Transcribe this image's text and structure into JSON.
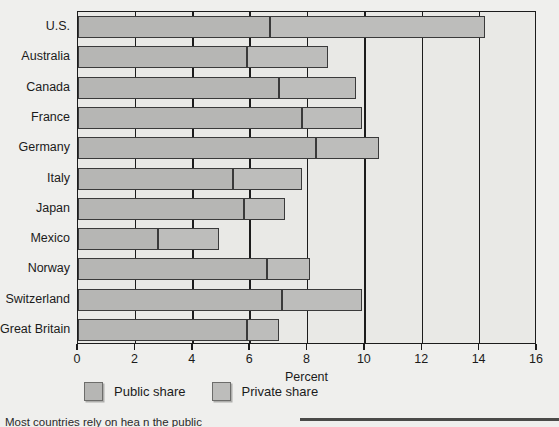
{
  "chart_data": {
    "type": "bar",
    "orientation": "horizontal",
    "stacked": true,
    "title": "",
    "xlabel": "Percent",
    "ylabel": "",
    "xlim": [
      0,
      16
    ],
    "xticks": [
      0,
      2,
      4,
      6,
      8,
      10,
      12,
      14,
      16
    ],
    "xticklabels": [
      "0",
      "2",
      "4",
      "6",
      "8",
      "10",
      "12",
      "14",
      "16"
    ],
    "grid": true,
    "grid_axis": "x",
    "legend_position": "below",
    "categories": [
      "U.S.",
      "Australia",
      "Canada",
      "France",
      "Germany",
      "Italy",
      "Japan",
      "Mexico",
      "Norway",
      "Switzerland",
      "Great Britain"
    ],
    "series": [
      {
        "name": "Public share",
        "color": "#b6b6b4",
        "values": [
          6.7,
          5.9,
          7.0,
          7.8,
          8.3,
          5.4,
          5.8,
          2.8,
          6.6,
          7.1,
          5.9
        ]
      },
      {
        "name": "Private share",
        "color": "#bdbdbb",
        "values": [
          7.5,
          2.8,
          2.7,
          2.1,
          2.2,
          2.4,
          1.4,
          2.1,
          1.5,
          2.8,
          1.1
        ]
      }
    ],
    "totals": [
      14.2,
      8.7,
      9.7,
      9.9,
      10.5,
      7.8,
      7.2,
      4.9,
      8.1,
      9.9,
      7.0
    ]
  },
  "legend": {
    "items": [
      {
        "label": "Public share",
        "swatch": "public-share-swatch"
      },
      {
        "label": "Private share",
        "swatch": "private-share-swatch"
      }
    ]
  },
  "axis": {
    "x_title": "Percent"
  },
  "caption": {
    "text": "Most countries rely on hea                       n the public"
  }
}
